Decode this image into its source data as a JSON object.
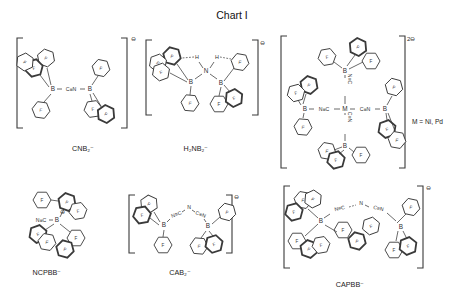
{
  "title": "Chart I",
  "palette": {
    "ink": "#3a3a3a",
    "background": "#ffffff"
  },
  "labels": {
    "f": "F",
    "b": "B",
    "n": "N",
    "h": "H"
  },
  "structures": {
    "cnb2": {
      "label": "CNB₂⁻",
      "charge": "⊖",
      "left_atom": "B",
      "bridge": "C≡N",
      "right_atom": "B"
    },
    "h2nb2": {
      "label": "H₂NB₂⁻",
      "charge": "⊖",
      "center_atom": "N",
      "h_left": "H",
      "h_right": "H",
      "left_atom": "B",
      "right_atom": "B"
    },
    "m_complex": {
      "charge": "2⊖",
      "note": "M = Ni, Pd",
      "center_atom": "M",
      "left_atom": "B",
      "right_atom": "B",
      "top_atom": "B",
      "bottom_atom": "B",
      "left_bridge": "N≡C",
      "right_bridge": "C≡N",
      "top_bridge": "N≡C",
      "bottom_bridge": "C≡N"
    },
    "ncpbb": {
      "label": "NCPBB⁻",
      "group": "N≡C",
      "atom": "B",
      "charge": "⊖"
    },
    "cab2": {
      "label": "CAB₂⁻",
      "charge": "⊖",
      "left_atom": "B",
      "right_atom": "B",
      "bridge_left": "N≡C",
      "bridge_apex": "N",
      "bridge_right": "C≡N"
    },
    "capbb": {
      "label": "CAPBB⁻",
      "charge": "⊖",
      "left_atom": "B",
      "right_atom": "B",
      "bridge_left": "N≡C",
      "bridge_mid": "N",
      "bridge_right": "C≡N"
    }
  }
}
